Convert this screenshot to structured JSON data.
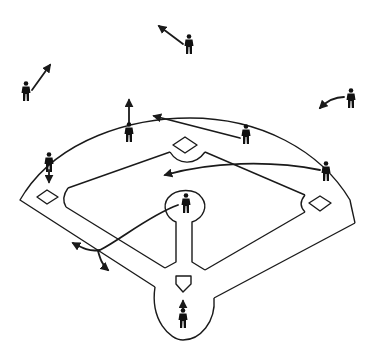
{
  "diagram": {
    "title": "",
    "colors": {
      "ink": "#1a1a1a",
      "background": "#ffffff"
    },
    "players": [
      {
        "id": "center-fielder",
        "x": 189,
        "y": 44
      },
      {
        "id": "left-fielder",
        "x": 26,
        "y": 91
      },
      {
        "id": "right-fielder",
        "x": 351,
        "y": 97
      },
      {
        "id": "shortstop",
        "x": 129,
        "y": 132
      },
      {
        "id": "second-baseman",
        "x": 246,
        "y": 135
      },
      {
        "id": "third-baseman",
        "x": 49,
        "y": 162
      },
      {
        "id": "first-baseman",
        "x": 326,
        "y": 171
      },
      {
        "id": "pitcher",
        "x": 186,
        "y": 204
      },
      {
        "id": "catcher",
        "x": 183,
        "y": 318
      }
    ],
    "arrows": [
      {
        "from": "center-fielder",
        "path": "M183,44 L159,26"
      },
      {
        "from": "left-fielder",
        "path": "M32,90 L50,65"
      },
      {
        "from": "right-fielder",
        "path": "M344,97 C334,97 326,102 320,108"
      },
      {
        "from": "shortstop",
        "path": "M129,124 L129,100"
      },
      {
        "from": "second-baseman",
        "path": "M240,138 L154,116"
      },
      {
        "from": "third-baseman",
        "path": "M49,170 L49,182"
      },
      {
        "from": "first-baseman",
        "path": "M320,170 C270,160 210,162 165,175"
      },
      {
        "from": "pitcher",
        "path": "M178,205 C150,215 120,240 100,250 C90,252 82,248 73,243"
      },
      {
        "from": "pitcher-branch",
        "path": "M98,251 C100,258 102,265 108,270"
      },
      {
        "from": "catcher",
        "path": "M183,310 L183,301"
      }
    ],
    "bases": [
      {
        "id": "second-base",
        "x": 185,
        "y": 145
      },
      {
        "id": "third-base",
        "x": 47,
        "y": 197
      },
      {
        "id": "first-base",
        "x": 320,
        "y": 204
      },
      {
        "id": "home-plate",
        "x": 183,
        "y": 283
      }
    ]
  }
}
